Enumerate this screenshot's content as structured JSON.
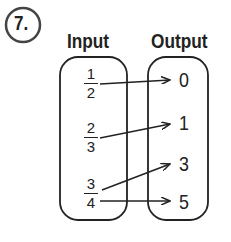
{
  "problem_number": "7.",
  "headers": {
    "input": "Input",
    "output": "Output"
  },
  "inputs": [
    {
      "num": "1",
      "den": "2"
    },
    {
      "num": "2",
      "den": "3"
    },
    {
      "num": "3",
      "den": "4"
    }
  ],
  "outputs": [
    "0",
    "1",
    "3",
    "5"
  ],
  "mappings": [
    {
      "from": "1/2",
      "to": "0"
    },
    {
      "from": "2/3",
      "to": "1"
    },
    {
      "from": "3/4",
      "to": "3"
    },
    {
      "from": "3/4",
      "to": "5"
    }
  ],
  "colors": {
    "stroke": "#222222",
    "circle": "#444444"
  }
}
